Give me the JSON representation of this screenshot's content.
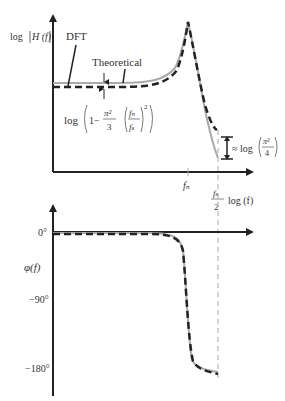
{
  "magnitude_plot": {
    "y_label": "log|H(f)|",
    "y_label_log": "log",
    "y_label_H": "H (f)",
    "legend_dft": "DFT",
    "legend_theoretical": "Theoretical",
    "offset_label_log": "log",
    "offset_label_one": "1−",
    "offset_label_pi2": "π²",
    "offset_label_3": "3",
    "offset_label_fn": "fₙ",
    "offset_label_fs": "fₛ",
    "offset_label_sq": "2",
    "nyquist_gap_approx": "≈ log",
    "nyquist_gap_pi2": "π²",
    "nyquist_gap_4": "4",
    "x_tick_fn": "fₙ",
    "x_tick_fs": "fₛ",
    "x_tick_2": "2",
    "x_axis_label": "log (f)"
  },
  "phase_plot": {
    "y_label": "φ(f)",
    "y_ticks": [
      "0°",
      "−90°",
      "−180°"
    ]
  },
  "colors": {
    "axis": "#222222",
    "dft_curve": "#222222",
    "theoretical_curve": "#aaaaaa",
    "guide_line": "#aaaaaa"
  }
}
